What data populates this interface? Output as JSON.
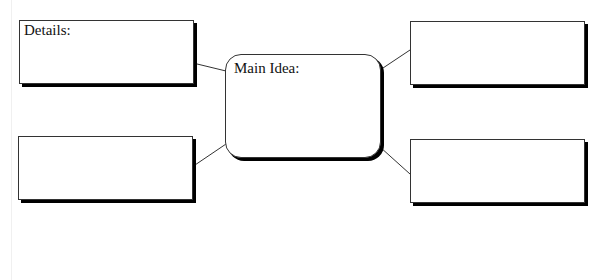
{
  "diagram": {
    "type": "main-idea-details-organizer",
    "colors": {
      "border": "#333333",
      "shadow": "#000000",
      "fill": "#ffffff",
      "text": "#111111"
    },
    "main_idea": {
      "label": "Main Idea:"
    },
    "detail_boxes": [
      {
        "position": "top-left",
        "label": "Details:"
      },
      {
        "position": "top-right",
        "label": ""
      },
      {
        "position": "bottom-left",
        "label": ""
      },
      {
        "position": "bottom-right",
        "label": ""
      }
    ],
    "connectors": [
      {
        "from": "top-left",
        "to": "main-idea"
      },
      {
        "from": "bottom-left",
        "to": "main-idea"
      },
      {
        "from": "main-idea",
        "to": "top-right"
      },
      {
        "from": "main-idea",
        "to": "bottom-right"
      }
    ]
  }
}
